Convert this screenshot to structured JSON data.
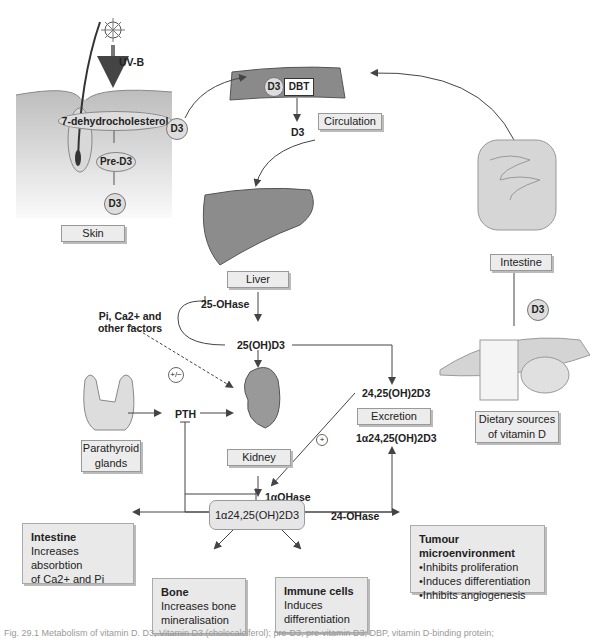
{
  "organs": {
    "skin": "Skin",
    "circulation": "Circulation",
    "liver": "Liver",
    "intestine_top": "Intestine",
    "kidney": "Kidney",
    "parathyroid": "Parathyroid glands",
    "dietary": "Dietary sources of vitamin D",
    "excretion": "Excretion"
  },
  "skin_panel": {
    "uv": "UV-B",
    "dehydro": "7-dehydrocholesterol",
    "pre_d3": "Pre-D3",
    "d3": "D3",
    "d3_out": "D3"
  },
  "circulation_panel": {
    "d3": "D3",
    "dbt": "DBT",
    "d3_out": "D3"
  },
  "metabolites": {
    "oh25": "25(OH)D3",
    "oh2425": "24,25(OH)2D3",
    "oh1a2425_excretion": "1α24,25(OH)2D3",
    "central": "1α24,25(OH)2D3",
    "d3_dietary": "D3"
  },
  "enzymes": {
    "ohase25": "25-OHase",
    "ohase1a": "1αOHase",
    "ohase24": "24-OHase"
  },
  "regulators": {
    "factors": "Pi, Ca2+ and other factors",
    "plus_minus": "+/−",
    "plus": "+",
    "pth": "PTH"
  },
  "effects": [
    {
      "title": "Intestine",
      "lines": [
        "Increases absorbtion",
        "of Ca2+ and Pi"
      ]
    },
    {
      "title": "Bone",
      "lines": [
        "Increases bone",
        "mineralisation"
      ]
    },
    {
      "title": "Immune cells",
      "lines": [
        "Induces",
        "differentiation"
      ]
    },
    {
      "title": "Tumour microenvironment",
      "bullets": [
        "Inhibits proliferation",
        "Induces differentiation",
        "Inhibits angiogenesis"
      ]
    }
  ],
  "caption": "Fig. 29.1 Metabolism of vitamin D. D3, Vitamin D3 (cholecalciferol); pre-D3, pre-vitamin D3; DBP, vitamin D-binding protein;"
}
